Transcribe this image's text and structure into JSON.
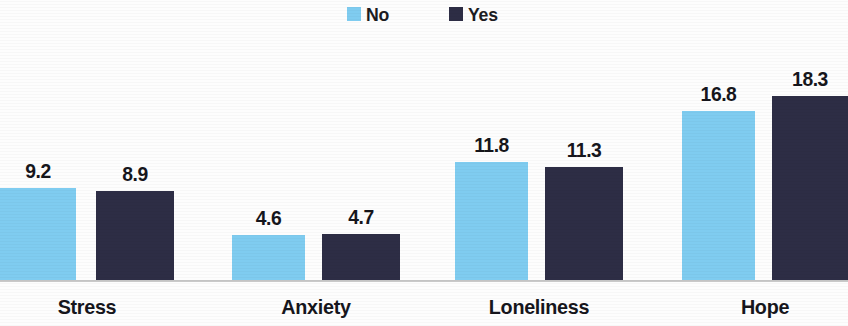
{
  "chart_data": {
    "type": "bar",
    "title": "",
    "subtitle": "",
    "xlabel": "",
    "ylabel": "",
    "grid": false,
    "legend_position": "top-center",
    "axis_line": true,
    "ylim": [
      0,
      19.5
    ],
    "categories": [
      "Stress",
      "Anxiety",
      "Loneliness",
      "Hope"
    ],
    "series": [
      {
        "name": "No",
        "color": "#7fccf0",
        "values": [
          9.2,
          4.6,
          11.8,
          16.8
        ],
        "labels": [
          "9.2",
          "4.6",
          "11.8",
          "16.8"
        ]
      },
      {
        "name": "Yes",
        "color": "#2d2d45",
        "values": [
          8.9,
          4.7,
          11.3,
          18.3
        ],
        "labels": [
          "8.9",
          "4.7",
          "11.3",
          "18.3"
        ]
      }
    ]
  },
  "legend": {
    "items": [
      {
        "label": "No",
        "color": "#7fccf0",
        "swatch_name": "legend-swatch-no"
      },
      {
        "label": "Yes",
        "color": "#2d2d45",
        "swatch_name": "legend-swatch-yes"
      }
    ]
  },
  "colors": {
    "series_no": "#7fccf0",
    "series_yes": "#2d2d45",
    "text": "#16161c",
    "axis": "#c9c9c9",
    "background": "#fdfdfd"
  },
  "geometry": {
    "groups": [
      {
        "category": "Stress",
        "center": 87,
        "no_x": 0,
        "yes_x": 96,
        "bar_width": 76,
        "yes_bar_width": 78
      },
      {
        "category": "Anxiety",
        "center": 316,
        "no_x": 232,
        "yes_x": 322,
        "bar_width": 73,
        "yes_bar_width": 78
      },
      {
        "category": "Loneliness",
        "center": 539,
        "no_x": 455,
        "yes_x": 545,
        "bar_width": 73,
        "yes_bar_width": 78
      },
      {
        "category": "Hope",
        "center": 765,
        "no_x": 682,
        "yes_x": 772,
        "bar_width": 73,
        "yes_bar_width": 76
      }
    ],
    "baseline_y": 280,
    "plot_height": 253,
    "px_per_unit": 10.1
  }
}
